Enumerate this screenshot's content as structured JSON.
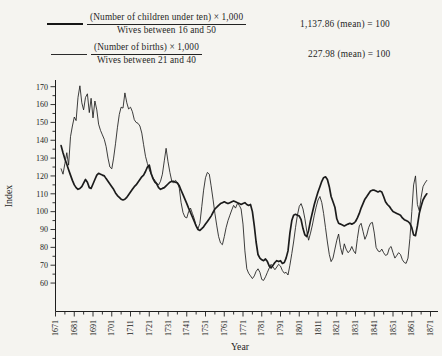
{
  "legend": {
    "rows": [
      {
        "numerator": "(Number of children under ten) × 1,000",
        "denominator": "Wives between 16 and 50",
        "mean": "1,137.86 (mean) = 100",
        "line_style": "thick"
      },
      {
        "numerator": "(Number of births) × 1,000",
        "denominator": "Wives between 21 and 40",
        "mean": "227.98 (mean) = 100",
        "line_style": "thin"
      }
    ]
  },
  "chart_data": {
    "type": "line",
    "title": "",
    "xlabel": "Year",
    "ylabel": "Index",
    "x_ticks": [
      1671,
      1681,
      1691,
      1701,
      1711,
      1721,
      1731,
      1741,
      1751,
      1761,
      1771,
      1781,
      1791,
      1801,
      1811,
      1821,
      1831,
      1841,
      1851,
      1861,
      1871
    ],
    "y_ticks": [
      60,
      70,
      80,
      90,
      100,
      110,
      120,
      130,
      140,
      150,
      160,
      170
    ],
    "xlim": [
      1671,
      1871
    ],
    "ylim": [
      60,
      170
    ],
    "grid": false,
    "legend_position": "top",
    "series": [
      {
        "name": "children-under-ten-per-1000-wives-16-50",
        "style": "thick",
        "mean": 1137.86,
        "start_year": 1674,
        "step": 1,
        "values": [
          137,
          133,
          129.5,
          126.5,
          123.5,
          120.5,
          117.5,
          115,
          113.5,
          112.5,
          113,
          114,
          116,
          118,
          116.5,
          113.5,
          113,
          115.5,
          118,
          120.5,
          121.5,
          121,
          120.5,
          120,
          118.5,
          117,
          115.5,
          114,
          112.5,
          110.5,
          109,
          108,
          107,
          106.5,
          107,
          108,
          109.5,
          111,
          112.5,
          114,
          115,
          116.5,
          118,
          119.5,
          120.5,
          122.5,
          125,
          126,
          121.5,
          118.5,
          116.5,
          115.5,
          113.5,
          112.5,
          113,
          113.5,
          114.5,
          115.5,
          116.5,
          117,
          117,
          116.5,
          116,
          114.5,
          112,
          109.5,
          107,
          104.5,
          102,
          99.5,
          97,
          94.5,
          92,
          90,
          89.5,
          90.5,
          91.5,
          93,
          94.5,
          96,
          97.5,
          99.5,
          101.5,
          102.5,
          103.5,
          104.5,
          105,
          105.5,
          105,
          104.5,
          105,
          105.5,
          106,
          105.5,
          105,
          104.5,
          104,
          104.5,
          105,
          104,
          103.5,
          104,
          100,
          92,
          83,
          76,
          74,
          73,
          72.5,
          73.5,
          72,
          69.5,
          68.5,
          70,
          71.5,
          72.5,
          72,
          72.5,
          71,
          71.5,
          74,
          78,
          88,
          95,
          98,
          98.5,
          98,
          97.5,
          95.5,
          90.5,
          87,
          86,
          89.5,
          95,
          99.5,
          104,
          107.5,
          111,
          114,
          117,
          119,
          119.5,
          118,
          114,
          108.5,
          105.5,
          102.5,
          96,
          93.5,
          93,
          92.5,
          92,
          92.5,
          93,
          93.5,
          93,
          93.5,
          94.5,
          96.5,
          99,
          102,
          104.5,
          107,
          108.5,
          110,
          111.5,
          112,
          112,
          111.5,
          111,
          111.5,
          111,
          108.5,
          105.5,
          104,
          103,
          101.5,
          100,
          99.5,
          99,
          98.5,
          98,
          96.5,
          95.5,
          95,
          94.5,
          93.5,
          91,
          87,
          86.5,
          92,
          99,
          103,
          106.5,
          108.5,
          110
        ]
      },
      {
        "name": "births-per-1000-wives-21-40",
        "style": "thin",
        "mean": 227.98,
        "start_year": 1674,
        "step": 1,
        "values": [
          124,
          121,
          127,
          133,
          126,
          142,
          148,
          153,
          151,
          164,
          170.5,
          161,
          157,
          164,
          166,
          155.5,
          163.5,
          152.5,
          162,
          157,
          149,
          145.5,
          143,
          140.5,
          136.5,
          130,
          125,
          124,
          130,
          138,
          147,
          154.5,
          158.5,
          158,
          166.5,
          161,
          157.5,
          158.5,
          156,
          151.5,
          150,
          149.5,
          148,
          144,
          137.5,
          131,
          127,
          123.5,
          121,
          119,
          117.5,
          116,
          115,
          117,
          121,
          128.5,
          135.5,
          128,
          122,
          117,
          116,
          117.5,
          116.5,
          113,
          105,
          99.5,
          97,
          96.5,
          100,
          102,
          99,
          96,
          92,
          90.5,
          93.5,
          103,
          112,
          119,
          122,
          121,
          114.5,
          107,
          99,
          92,
          86,
          82.5,
          81.5,
          86,
          91,
          95,
          98,
          101,
          103.5,
          102,
          104.5,
          103.5,
          101.5,
          93,
          78,
          68,
          65.5,
          64,
          62.5,
          64,
          66.5,
          68,
          66,
          62,
          61.5,
          63.5,
          66,
          68.5,
          70.5,
          69,
          67.5,
          69,
          70.5,
          69.5,
          67,
          65.5,
          66,
          64.5,
          70,
          76.5,
          83,
          91,
          98,
          103,
          104.5,
          101.5,
          96,
          89,
          84,
          88,
          92.5,
          98,
          102.5,
          106.5,
          108.5,
          105,
          99,
          91,
          83,
          76,
          72,
          74,
          79,
          84,
          87.5,
          80,
          76,
          82,
          79,
          77,
          78,
          80.5,
          78,
          76.5,
          85,
          92,
          93.5,
          89,
          84.5,
          87,
          91,
          93.5,
          94,
          88,
          80,
          78,
          77.5,
          79,
          77,
          75.5,
          76,
          79.5,
          80.5,
          77,
          74,
          75.5,
          77,
          76,
          73,
          71.5,
          71,
          74,
          85,
          100,
          115,
          120,
          104,
          100.5,
          108,
          114,
          116,
          117.5
        ]
      }
    ]
  }
}
